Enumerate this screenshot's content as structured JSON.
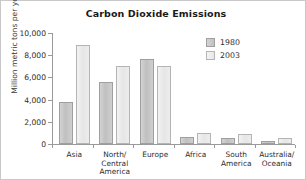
{
  "chart_data": {
    "type": "bar",
    "title": "Carbon Dioxide Emissions",
    "xlabel": "",
    "ylabel": "Million metric tons per year",
    "ylim": [
      0,
      10000
    ],
    "ytick_labels": [
      "10,000",
      "8,000",
      "6,000",
      "4,000",
      "2,000",
      "0"
    ],
    "ytick_values": [
      10000,
      8000,
      6000,
      4000,
      2000,
      0
    ],
    "grid": false,
    "legend_position": "top-right",
    "categories": [
      "Asia",
      "North/ Central America",
      "Europe",
      "Africa",
      "South America",
      "Australia/ Oceania"
    ],
    "category_lines": [
      [
        "Asia"
      ],
      [
        "North/",
        "Central",
        "America"
      ],
      [
        "Europe"
      ],
      [
        "Africa"
      ],
      [
        "South",
        "America"
      ],
      [
        "Australia/",
        "Oceania"
      ]
    ],
    "series": [
      {
        "name": "1980",
        "color": "#c6c6c6",
        "values": [
          3800,
          5600,
          7700,
          600,
          550,
          250
        ]
      },
      {
        "name": "2003",
        "color": "#ececec",
        "values": [
          8900,
          7000,
          7000,
          1000,
          900,
          500
        ]
      }
    ]
  },
  "legend": {
    "entries": [
      {
        "label": "1980"
      },
      {
        "label": "2003"
      }
    ]
  }
}
